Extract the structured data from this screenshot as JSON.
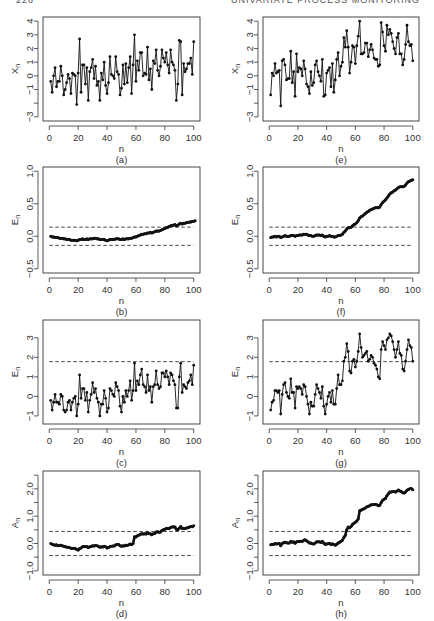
{
  "header": {
    "page_number": "226",
    "running_head": "UNIVARIATE PROCESS MONITORING"
  },
  "chart_data": [
    {
      "id": "a",
      "type": "line",
      "caption": "(a)",
      "xlabel": "n",
      "ylabel": "Xn",
      "xlim": [
        0,
        100
      ],
      "ylim": [
        -3,
        4
      ],
      "xticks": [
        0,
        20,
        40,
        60,
        80,
        100
      ],
      "yticks": [
        -3,
        -2,
        -1,
        0,
        1,
        2,
        3,
        4
      ],
      "ytick_labels": [
        "-3",
        "",
        "-1",
        "0",
        "1",
        "2",
        "3",
        "4"
      ],
      "markers": true,
      "control_limits": [],
      "y": [
        -0.4,
        -1.2,
        0.0,
        0.6,
        -0.8,
        -0.4,
        -0.4,
        0.7,
        0.0,
        -1.4,
        -1.0,
        -0.5,
        0.1,
        -0.2,
        -1.3,
        0.2,
        0.1,
        0.0,
        -2.1,
        0.2,
        2.7,
        -1.2,
        0.8,
        0.8,
        -0.6,
        0.6,
        -1.8,
        0.3,
        0.6,
        1.2,
        -0.2,
        0.7,
        -0.7,
        -0.4,
        -1.8,
        0.2,
        -0.3,
        1.0,
        -0.7,
        -1.3,
        -0.5,
        1.4,
        0.1,
        0.0,
        -0.2,
        1.4,
        0.3,
        0.1,
        -1.4,
        -0.9,
        0.8,
        -0.6,
        0.9,
        -0.5,
        0.6,
        1.4,
        -1.3,
        0.8,
        3.0,
        -0.4,
        1.1,
        0.4,
        1.7,
        1.7,
        0.0,
        0.2,
        0.1,
        2.1,
        -0.3,
        0.5,
        -1.0,
        1.1,
        0.9,
        1.9,
        0.4,
        0.0,
        0.7,
        1.9,
        1.3,
        1.0,
        1.7,
        0.8,
        0.2,
        1.9,
        1.0,
        0.8,
        0.4,
        -1.8,
        -0.6,
        2.6,
        2.5,
        -1.4,
        0.9,
        0.3,
        0.5,
        0.9,
        0.9,
        1.3,
        0.1,
        2.5
      ]
    },
    {
      "id": "b",
      "type": "line",
      "caption": "(b)",
      "xlabel": "n",
      "ylabel": "En",
      "xlim": [
        0,
        100
      ],
      "ylim": [
        -0.5,
        1.0
      ],
      "xticks": [
        0,
        20,
        40,
        60,
        80,
        100
      ],
      "yticks": [
        -0.5,
        0.0,
        0.5,
        1.0
      ],
      "ytick_labels": [
        "-0.5",
        "0.0",
        "0.5",
        "1.0"
      ],
      "markers": "dense",
      "control_limits": [
        0.14,
        -0.14
      ],
      "y": [
        0.0,
        -0.01,
        -0.01,
        -0.02,
        -0.02,
        -0.02,
        -0.03,
        -0.03,
        -0.03,
        -0.04,
        -0.04,
        -0.05,
        -0.05,
        -0.05,
        -0.06,
        -0.06,
        -0.06,
        -0.06,
        -0.07,
        -0.06,
        -0.05,
        -0.05,
        -0.04,
        -0.05,
        -0.05,
        -0.04,
        -0.05,
        -0.04,
        -0.04,
        -0.04,
        -0.03,
        -0.03,
        -0.04,
        -0.04,
        -0.05,
        -0.05,
        -0.05,
        -0.05,
        -0.06,
        -0.07,
        -0.06,
        -0.05,
        -0.05,
        -0.05,
        -0.05,
        -0.04,
        -0.04,
        -0.04,
        -0.05,
        -0.05,
        -0.04,
        -0.05,
        -0.04,
        -0.04,
        -0.04,
        -0.03,
        -0.03,
        -0.02,
        -0.01,
        -0.01,
        0.0,
        0.01,
        0.02,
        0.03,
        0.03,
        0.04,
        0.04,
        0.05,
        0.05,
        0.06,
        0.05,
        0.06,
        0.07,
        0.08,
        0.08,
        0.08,
        0.09,
        0.1,
        0.11,
        0.12,
        0.13,
        0.14,
        0.15,
        0.16,
        0.17,
        0.17,
        0.18,
        0.16,
        0.17,
        0.19,
        0.2,
        0.19,
        0.2,
        0.2,
        0.21,
        0.21,
        0.22,
        0.22,
        0.23,
        0.23,
        0.24
      ]
    },
    {
      "id": "c",
      "type": "line",
      "caption": "(c)",
      "xlabel": "n",
      "ylabel": "En",
      "xlim": [
        0,
        100
      ],
      "ylim": [
        -1.2,
        3.7
      ],
      "xticks": [
        0,
        20,
        40,
        60,
        80,
        100
      ],
      "yticks": [
        -1,
        0,
        1,
        2,
        3
      ],
      "ytick_labels": [
        "-1",
        "0",
        "1",
        "2",
        "3"
      ],
      "markers": true,
      "control_limits": [
        1.78
      ],
      "y": [
        -0.2,
        -0.7,
        -0.3,
        0.1,
        -0.3,
        -0.3,
        -0.4,
        0.1,
        0.0,
        -0.7,
        -0.8,
        -0.7,
        -0.3,
        -0.2,
        -0.7,
        -0.3,
        -0.1,
        0.0,
        -1.0,
        -0.4,
        1.1,
        -0.1,
        0.4,
        0.4,
        -0.2,
        0.2,
        -0.8,
        -0.2,
        0.1,
        0.7,
        0.2,
        0.4,
        -0.1,
        -0.3,
        -1.0,
        -0.4,
        -0.4,
        0.3,
        -0.1,
        -0.8,
        -0.6,
        0.4,
        0.3,
        0.1,
        0.0,
        0.7,
        0.5,
        0.3,
        -0.5,
        -0.8,
        0.0,
        -0.3,
        0.3,
        0.0,
        0.3,
        0.8,
        -0.2,
        0.3,
        1.7,
        0.3,
        0.8,
        0.6,
        1.1,
        1.4,
        0.6,
        0.5,
        0.2,
        1.1,
        0.3,
        0.5,
        -0.3,
        0.5,
        0.6,
        1.3,
        0.6,
        0.4,
        0.5,
        1.2,
        1.2,
        1.0,
        1.3,
        1.0,
        0.6,
        1.2,
        1.1,
        0.8,
        0.6,
        -0.6,
        -0.6,
        1.0,
        1.7,
        0.2,
        0.6,
        0.5,
        0.4,
        0.7,
        0.8,
        1.1,
        0.6,
        1.6
      ]
    },
    {
      "id": "d",
      "type": "line",
      "caption": "(d)",
      "xlabel": "n",
      "ylabel": "An",
      "xlim": [
        0,
        100
      ],
      "ylim": [
        -1.0,
        2.5
      ],
      "xticks": [
        0,
        20,
        40,
        60,
        80,
        100
      ],
      "yticks": [
        -1.0,
        -0.5,
        0.0,
        0.5,
        1.0,
        1.5,
        2.0,
        2.5
      ],
      "ytick_labels": [
        "-1.0",
        "",
        "0.0",
        "",
        "1.0",
        "",
        "2.0",
        ""
      ],
      "markers": "dense",
      "control_limits": [
        0.44,
        -0.44
      ],
      "y": [
        0.0,
        -0.03,
        -0.05,
        -0.06,
        -0.05,
        -0.08,
        -0.07,
        -0.06,
        -0.08,
        -0.1,
        -0.12,
        -0.13,
        -0.14,
        -0.15,
        -0.17,
        -0.18,
        -0.17,
        -0.18,
        -0.22,
        -0.24,
        -0.18,
        -0.16,
        -0.12,
        -0.11,
        -0.12,
        -0.11,
        -0.15,
        -0.12,
        -0.11,
        -0.08,
        -0.09,
        -0.07,
        -0.08,
        -0.1,
        -0.14,
        -0.12,
        -0.13,
        -0.1,
        -0.12,
        -0.16,
        -0.15,
        -0.11,
        -0.1,
        -0.09,
        -0.09,
        -0.05,
        -0.04,
        -0.04,
        -0.08,
        -0.1,
        -0.08,
        -0.09,
        -0.06,
        -0.07,
        -0.05,
        -0.02,
        -0.04,
        0.0,
        0.25,
        0.24,
        0.28,
        0.3,
        0.34,
        0.36,
        0.35,
        0.36,
        0.35,
        0.39,
        0.36,
        0.36,
        0.32,
        0.36,
        0.37,
        0.42,
        0.43,
        0.41,
        0.42,
        0.48,
        0.5,
        0.52,
        0.55,
        0.56,
        0.55,
        0.59,
        0.6,
        0.61,
        0.6,
        0.52,
        0.5,
        0.56,
        0.62,
        0.55,
        0.56,
        0.55,
        0.57,
        0.58,
        0.6,
        0.62,
        0.61,
        0.65
      ]
    },
    {
      "id": "e",
      "type": "line",
      "caption": "(e)",
      "xlabel": "n",
      "ylabel": "Xn",
      "xlim": [
        0,
        100
      ],
      "ylim": [
        -3,
        4
      ],
      "xticks": [
        0,
        20,
        40,
        60,
        80,
        100
      ],
      "yticks": [
        -3,
        -2,
        -1,
        0,
        1,
        2,
        3,
        4
      ],
      "ytick_labels": [
        "-3",
        "",
        "-1",
        "0",
        "1",
        "2",
        "3",
        "4"
      ],
      "markers": true,
      "control_limits": [],
      "y": [
        -1.4,
        0.2,
        0.0,
        0.9,
        0.2,
        0.3,
        0.4,
        -2.2,
        1.1,
        1.2,
        0.8,
        -0.3,
        -0.2,
        -0.2,
        1.8,
        -0.5,
        0.3,
        -1.5,
        1.6,
        0.3,
        0.6,
        0.5,
        0.0,
        1.1,
        0.5,
        -0.6,
        -0.8,
        -1.3,
        0.3,
        -0.7,
        -0.5,
        0.8,
        1.1,
        0.3,
        0.0,
        -0.4,
        1.2,
        -1.5,
        -1.4,
        0.2,
        0.4,
        0.6,
        -0.8,
        0.9,
        -1.2,
        -0.3,
        1.2,
        1.7,
        0.0,
        0.7,
        1.0,
        2.8,
        2.1,
        3.3,
        2.1,
        0.2,
        1.0,
        2.2,
        2.1,
        0.9,
        2.2,
        2.9,
        4.0,
        1.6,
        1.6,
        1.7,
        2.4,
        2.4,
        1.4,
        1.9,
        2.3,
        1.9,
        1.3,
        1.2,
        1.2,
        0.7,
        0.8,
        3.9,
        3.2,
        2.2,
        1.8,
        3.7,
        3.0,
        3.4,
        3.1,
        2.5,
        2.0,
        1.6,
        2.8,
        3.1,
        1.6,
        1.6,
        0.8,
        1.2,
        2.3,
        3.7,
        2.5,
        2.2,
        2.3,
        1.1
      ]
    },
    {
      "id": "f",
      "type": "line",
      "caption": "(f)",
      "xlabel": "n",
      "ylabel": "En",
      "xlim": [
        0,
        100
      ],
      "ylim": [
        -0.5,
        1.0
      ],
      "xticks": [
        0,
        20,
        40,
        60,
        80,
        100
      ],
      "yticks": [
        -0.5,
        0.0,
        0.5,
        1.0
      ],
      "ytick_labels": [
        "-0.5",
        "0.0",
        "0.5",
        "1.0"
      ],
      "markers": "dense",
      "control_limits": [
        0.14,
        -0.14
      ],
      "y": [
        -0.02,
        -0.01,
        -0.01,
        0.0,
        -0.01,
        0.0,
        0.0,
        -0.02,
        -0.01,
        0.0,
        0.01,
        0.0,
        0.0,
        0.0,
        0.01,
        0.01,
        0.01,
        0.0,
        0.01,
        0.01,
        0.02,
        0.02,
        0.02,
        0.03,
        0.03,
        0.03,
        0.02,
        0.01,
        0.01,
        0.0,
        0.0,
        0.01,
        0.02,
        0.02,
        0.02,
        0.01,
        0.02,
        0.0,
        -0.01,
        0.0,
        0.0,
        0.01,
        0.0,
        0.0,
        -0.01,
        -0.01,
        0.0,
        0.01,
        0.01,
        0.02,
        0.03,
        0.06,
        0.08,
        0.11,
        0.13,
        0.13,
        0.14,
        0.16,
        0.18,
        0.19,
        0.21,
        0.24,
        0.28,
        0.3,
        0.31,
        0.33,
        0.35,
        0.37,
        0.38,
        0.4,
        0.41,
        0.42,
        0.43,
        0.44,
        0.44,
        0.44,
        0.45,
        0.49,
        0.52,
        0.54,
        0.56,
        0.59,
        0.62,
        0.65,
        0.67,
        0.68,
        0.7,
        0.71,
        0.73,
        0.75,
        0.76,
        0.76,
        0.76,
        0.77,
        0.79,
        0.82,
        0.84,
        0.85,
        0.86,
        0.87
      ]
    },
    {
      "id": "g",
      "type": "line",
      "caption": "(g)",
      "xlabel": "n",
      "ylabel": "En",
      "xlim": [
        0,
        100
      ],
      "ylim": [
        -1.2,
        3.7
      ],
      "xticks": [
        0,
        20,
        40,
        60,
        80,
        100
      ],
      "yticks": [
        -1,
        0,
        1,
        2,
        3
      ],
      "ytick_labels": [
        "-1",
        "0",
        "1",
        "2",
        "3"
      ],
      "markers": true,
      "control_limits": [
        1.78
      ],
      "y": [
        -0.7,
        -0.3,
        -0.2,
        0.3,
        0.3,
        0.2,
        0.3,
        -0.9,
        0.1,
        0.6,
        0.7,
        0.2,
        0.0,
        -0.1,
        0.9,
        0.2,
        0.2,
        -0.6,
        0.5,
        0.4,
        0.5,
        0.4,
        0.1,
        0.6,
        0.5,
        0.0,
        -0.4,
        -0.9,
        -0.3,
        -0.5,
        -0.5,
        0.1,
        0.6,
        0.4,
        0.2,
        -0.1,
        0.5,
        -0.5,
        -0.9,
        -0.4,
        0.0,
        0.2,
        -0.3,
        0.3,
        -0.4,
        -0.4,
        0.4,
        1.1,
        0.6,
        0.6,
        0.8,
        1.8,
        2.0,
        2.7,
        2.3,
        1.3,
        1.2,
        1.8,
        1.9,
        1.5,
        1.8,
        2.3,
        3.2,
        2.5,
        2.0,
        2.1,
        2.2,
        2.3,
        1.8,
        1.9,
        2.1,
        2.0,
        1.7,
        1.6,
        1.4,
        1.0,
        0.9,
        2.4,
        2.8,
        2.6,
        2.4,
        2.9,
        3.0,
        3.2,
        3.1,
        2.8,
        2.4,
        2.0,
        2.4,
        2.8,
        2.2,
        2.1,
        1.4,
        1.3,
        1.8,
        2.4,
        2.9,
        2.6,
        2.5,
        1.8
      ]
    },
    {
      "id": "h",
      "type": "line",
      "caption": "(h)",
      "xlabel": "n",
      "ylabel": "An",
      "xlim": [
        0,
        100
      ],
      "ylim": [
        -1.0,
        2.5
      ],
      "xticks": [
        0,
        20,
        40,
        60,
        80,
        100
      ],
      "yticks": [
        -1.0,
        -0.5,
        0.0,
        0.5,
        1.0,
        1.5,
        2.0,
        2.5
      ],
      "ytick_labels": [
        "-1.0",
        "",
        "0.0",
        "",
        "1.0",
        "",
        "2.0",
        ""
      ],
      "markers": "dense",
      "control_limits": [
        0.44,
        -0.44
      ],
      "y": [
        -0.05,
        -0.03,
        -0.04,
        0.0,
        -0.02,
        -0.01,
        0.0,
        -0.08,
        0.0,
        0.03,
        0.05,
        0.03,
        0.02,
        0.02,
        0.08,
        0.05,
        0.06,
        0.01,
        0.06,
        0.07,
        0.08,
        0.08,
        0.07,
        0.12,
        0.14,
        0.1,
        0.06,
        0.02,
        0.02,
        -0.01,
        -0.02,
        0.02,
        0.06,
        0.06,
        0.06,
        0.04,
        0.08,
        0.02,
        -0.03,
        -0.02,
        -0.01,
        0.01,
        -0.04,
        -0.01,
        -0.04,
        -0.06,
        -0.03,
        0.02,
        0.05,
        0.08,
        0.12,
        0.22,
        0.3,
        0.5,
        0.6,
        0.58,
        0.62,
        0.7,
        0.74,
        0.78,
        0.82,
        0.9,
        1.2,
        1.22,
        1.25,
        1.27,
        1.3,
        1.34,
        1.36,
        1.38,
        1.42,
        1.42,
        1.43,
        1.43,
        1.42,
        1.38,
        1.4,
        1.5,
        1.58,
        1.62,
        1.65,
        1.75,
        1.82,
        1.88,
        1.88,
        1.9,
        1.9,
        1.88,
        1.92,
        1.96,
        1.92,
        1.9,
        1.86,
        1.85,
        1.88,
        1.95,
        1.98,
        2.0,
        2.01,
        1.97
      ]
    }
  ]
}
